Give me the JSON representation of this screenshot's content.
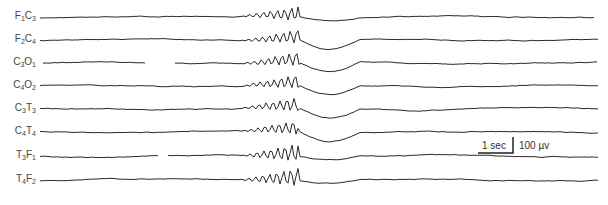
{
  "figure": {
    "type": "EEG recording",
    "channels": [
      {
        "lead_a": "F",
        "sub_a": "1",
        "lead_b": "C",
        "sub_b": "3",
        "label": "F1C3",
        "y": 17
      },
      {
        "lead_a": "F",
        "sub_a": "2",
        "lead_b": "C",
        "sub_b": "4",
        "label": "F2C4",
        "y": 40
      },
      {
        "lead_a": "C",
        "sub_a": "3",
        "lead_b": "O",
        "sub_b": "1",
        "label": "C3O1",
        "y": 63
      },
      {
        "lead_a": "C",
        "sub_a": "4",
        "lead_b": "O",
        "sub_b": "2",
        "label": "C4O2",
        "y": 86
      },
      {
        "lead_a": "C",
        "sub_a": "3",
        "lead_b": "T",
        "sub_b": "3",
        "label": "C3T3",
        "y": 109
      },
      {
        "lead_a": "C",
        "sub_a": "4",
        "lead_b": "T",
        "sub_b": "4",
        "label": "C4T4",
        "y": 132
      },
      {
        "lead_a": "T",
        "sub_a": "3",
        "lead_b": "F",
        "sub_b": "1",
        "label": "T3F1",
        "y": 156
      },
      {
        "lead_a": "T",
        "sub_a": "4",
        "lead_b": "F",
        "sub_b": "2",
        "label": "T4F2",
        "y": 180
      }
    ],
    "scale_bar": {
      "time_label": "1 sec",
      "amplitude_label": "100 µv"
    },
    "trace_color": "#2a2a2a"
  }
}
